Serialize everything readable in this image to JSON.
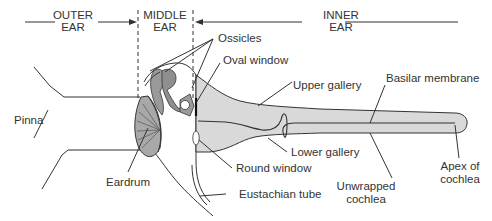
{
  "regions": {
    "outer": {
      "line1": "OUTER",
      "line2": "EAR"
    },
    "middle": {
      "line1": "MIDDLE",
      "line2": "EAR"
    },
    "inner": {
      "line1": "INNER",
      "line2": "EAR"
    }
  },
  "labels": {
    "ossicles": "Ossicles",
    "oval_window": "Oval window",
    "upper_gallery": "Upper gallery",
    "basilar_membrane": "Basilar membrane",
    "pinna": "Pinna",
    "eardrum": "Eardrum",
    "round_window": "Round window",
    "lower_gallery": "Lower gallery",
    "eustachian_tube": "Eustachian tube",
    "unwrapped_cochlea_1": "Unwrapped",
    "unwrapped_cochlea_2": "cochlea",
    "apex_1": "Apex of",
    "apex_2": "cochlea"
  },
  "colors": {
    "line": "#333333",
    "cochlea_fill": "#d9d9d9",
    "ossicle_fill": "#9a9a9a",
    "eardrum_fill": "#a8a8a8"
  }
}
